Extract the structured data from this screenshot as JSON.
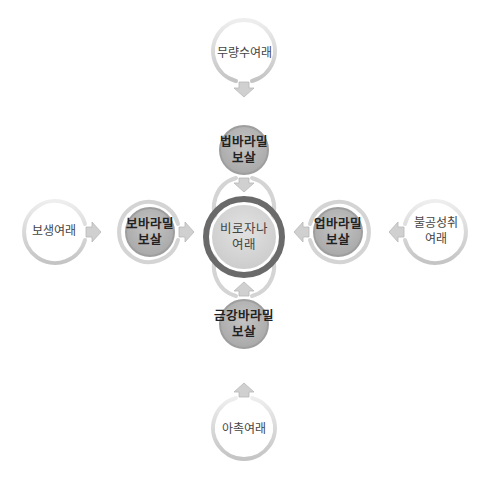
{
  "diagram": {
    "center": {
      "line1": "비로자나",
      "line2": "여래"
    },
    "inner_nodes": {
      "top": {
        "line1": "법바라밀",
        "line2": "보살"
      },
      "left": {
        "line1": "보바라밀",
        "line2": "보살"
      },
      "right": {
        "line1": "업바라밀",
        "line2": "보살"
      },
      "bottom": {
        "line1": "금강바라밀",
        "line2": "보살"
      }
    },
    "outer_nodes": {
      "top": {
        "line1": "무량수여래",
        "line2": ""
      },
      "left": {
        "line1": "보생여래",
        "line2": ""
      },
      "right": {
        "line1": "불공성취",
        "line2": "여래"
      },
      "bottom": {
        "line1": "아촉여래",
        "line2": ""
      }
    },
    "colors": {
      "ring_light": "#d9d9d9",
      "ring_shadow": "#bdbdbd",
      "inner_fill": "#b5b5b5",
      "inner_ring": "#9a9a9a",
      "center_fill": "#d6d6d6",
      "center_ring": "#6e6e6e",
      "arrow": "#cfcfcf"
    }
  }
}
